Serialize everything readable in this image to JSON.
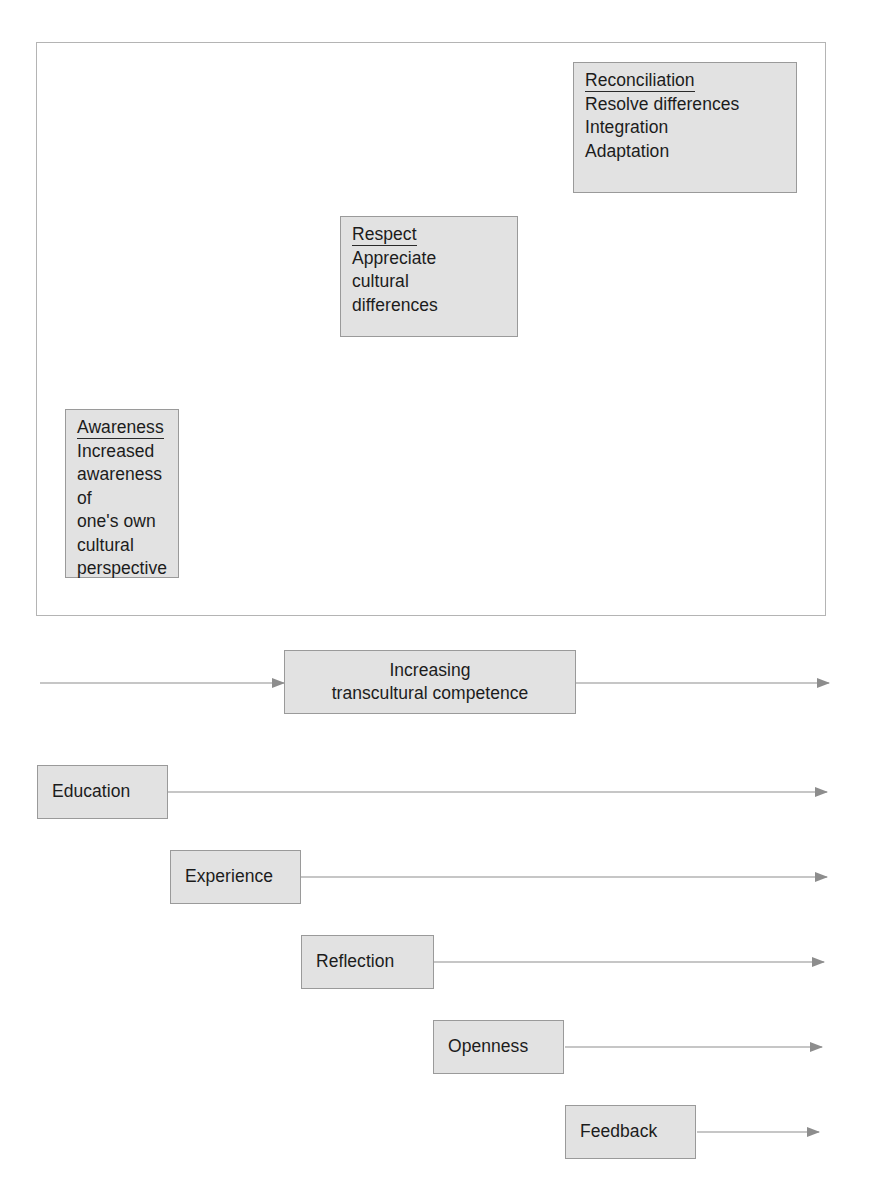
{
  "diagram": {
    "title_absent": "",
    "stages": [
      {
        "name": "awareness-stage",
        "heading": "Awareness",
        "body": "Increased awareness of one's own cultural perspective",
        "lines": [
          "Increased",
          "awareness of",
          "one's own",
          "cultural",
          "perspective"
        ]
      },
      {
        "name": "respect-stage",
        "heading": "Respect",
        "body": "Appreciate cultural differences",
        "lines": [
          "Appreciate",
          "cultural",
          "differences"
        ]
      },
      {
        "name": "reconciliation-stage",
        "heading": "Reconciliation",
        "body": "Resolve differences Integration Adaptation",
        "lines": [
          "Resolve differences",
          "Integration",
          "Adaptation"
        ]
      }
    ],
    "competence": {
      "line1": "Increasing",
      "line2": "transcultural competence"
    },
    "drivers": [
      {
        "label": "Education"
      },
      {
        "label": "Experience"
      },
      {
        "label": "Reflection"
      },
      {
        "label": "Openness"
      },
      {
        "label": "Feedback"
      }
    ],
    "colors": {
      "box_fill": "#e2e2e2",
      "box_border": "#9a9a9a",
      "frame_border": "#b4b4b4",
      "arrow": "#8d8d8d",
      "text": "#1c1c1c"
    }
  }
}
